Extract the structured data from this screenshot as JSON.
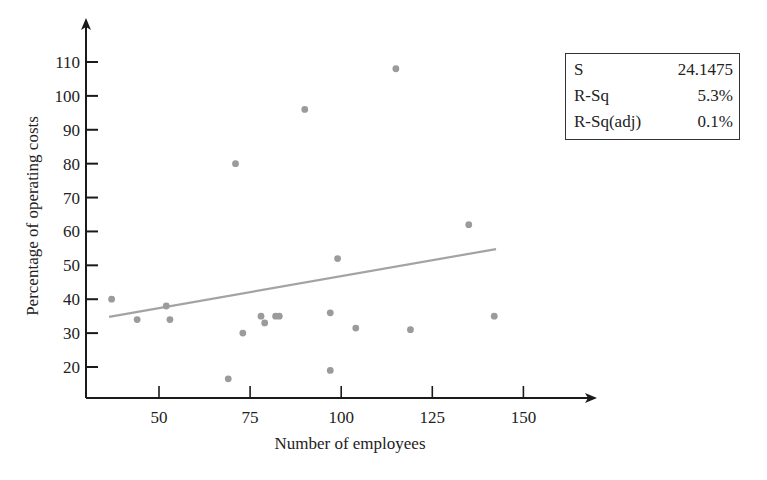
{
  "chart_data": {
    "type": "scatter",
    "title": "",
    "xlabel": "Number of employees",
    "ylabel": "Percentage of operating costs",
    "xlim": [
      30,
      163
    ],
    "ylim": [
      11,
      123
    ],
    "x_ticks": [
      50,
      75,
      100,
      125,
      150
    ],
    "y_ticks": [
      20,
      30,
      40,
      50,
      60,
      70,
      80,
      90,
      100,
      110
    ],
    "grid": false,
    "points": [
      {
        "x": 37,
        "y": 40
      },
      {
        "x": 44,
        "y": 34
      },
      {
        "x": 52,
        "y": 38
      },
      {
        "x": 53,
        "y": 34
      },
      {
        "x": 69,
        "y": 16.5
      },
      {
        "x": 71,
        "y": 80
      },
      {
        "x": 73,
        "y": 30
      },
      {
        "x": 78,
        "y": 35
      },
      {
        "x": 79,
        "y": 33
      },
      {
        "x": 82,
        "y": 35
      },
      {
        "x": 83,
        "y": 35
      },
      {
        "x": 90,
        "y": 96
      },
      {
        "x": 97,
        "y": 19
      },
      {
        "x": 97,
        "y": 36
      },
      {
        "x": 99,
        "y": 52
      },
      {
        "x": 104,
        "y": 31.5
      },
      {
        "x": 115,
        "y": 108
      },
      {
        "x": 119,
        "y": 31
      },
      {
        "x": 135,
        "y": 62
      },
      {
        "x": 142,
        "y": 35
      }
    ],
    "fit_line": {
      "x1": 36.3,
      "y1": 34.8,
      "x2": 142.5,
      "y2": 54.8
    },
    "stats": [
      {
        "label": "S",
        "value": "24.1475"
      },
      {
        "label": "R-Sq",
        "value": "5.3%"
      },
      {
        "label": "R-Sq(adj)",
        "value": "0.1%"
      }
    ],
    "colors": {
      "points": "#9b9b9b",
      "fit_line": "#a3a3a3",
      "axes": "#1a1a1a"
    }
  }
}
